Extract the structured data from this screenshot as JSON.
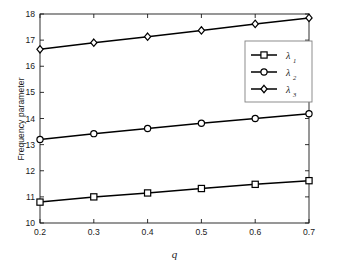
{
  "chart_data": {
    "type": "line",
    "title": "",
    "xlabel": "q",
    "ylabel": "Frequency parameter",
    "x": [
      0.2,
      0.3,
      0.4,
      0.5,
      0.6,
      0.7
    ],
    "xlim": [
      0.2,
      0.7
    ],
    "ylim": [
      10,
      18
    ],
    "xticks": [
      "0.2",
      "0.3",
      "0.4",
      "0.5",
      "0.6",
      "0.7"
    ],
    "yticks": [
      "10",
      "11",
      "12",
      "13",
      "14",
      "15",
      "16",
      "17",
      "18"
    ],
    "grid": false,
    "legend_position": "upper right",
    "series": [
      {
        "name": "λ",
        "subscript": "1",
        "marker": "square",
        "color": "#000000",
        "values": [
          10.8,
          11.0,
          11.15,
          11.32,
          11.48,
          11.62
        ]
      },
      {
        "name": "λ",
        "subscript": "2",
        "marker": "circle",
        "color": "#000000",
        "values": [
          13.2,
          13.42,
          13.62,
          13.82,
          14.0,
          14.18
        ]
      },
      {
        "name": "λ",
        "subscript": "3",
        "marker": "diamond",
        "color": "#000000",
        "values": [
          16.65,
          16.9,
          17.13,
          17.37,
          17.62,
          17.85
        ]
      }
    ]
  },
  "axis": {
    "y_label": "Frequency parameter",
    "x_label": "q"
  },
  "legend": {
    "entries": [
      {
        "label": "λ",
        "sub": "1",
        "marker": "square"
      },
      {
        "label": "λ",
        "sub": "2",
        "marker": "circle"
      },
      {
        "label": "λ",
        "sub": "3",
        "marker": "diamond"
      }
    ]
  },
  "colors": {
    "line": "#000000",
    "axis": "#1a1a1a",
    "background": "#ffffff",
    "legend_border": "#808080"
  }
}
